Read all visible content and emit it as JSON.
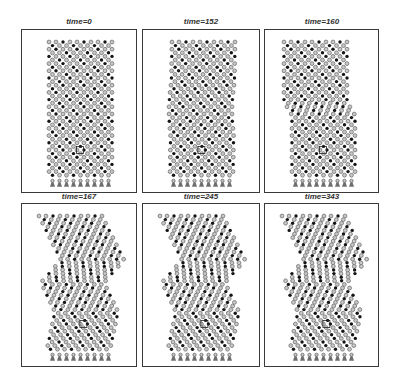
{
  "figure": {
    "colors": {
      "frame": "#3a3a3a",
      "ring": "#7d7d7d",
      "ring_fill": "#c8c8c8",
      "dot": "#151515",
      "anchor": "#6e6e6e",
      "title": "#333333"
    },
    "panels": [
      {
        "title": "time=0",
        "box": [
          21,
          29,
          116,
          164
        ],
        "shear": "none"
      },
      {
        "title": "time=152",
        "box": [
          142,
          29,
          118,
          164
        ],
        "shear": "slight"
      },
      {
        "title": "time=160",
        "box": [
          264,
          29,
          115,
          164
        ],
        "shear": "kink"
      },
      {
        "title": "time=167",
        "box": [
          21,
          203,
          116,
          164
        ],
        "shear": "zigzag"
      },
      {
        "title": "time=245",
        "box": [
          142,
          203,
          118,
          164
        ],
        "shear": "zigzag"
      },
      {
        "title": "time=343",
        "box": [
          264,
          203,
          115,
          164
        ],
        "shear": "zigzag"
      }
    ]
  }
}
